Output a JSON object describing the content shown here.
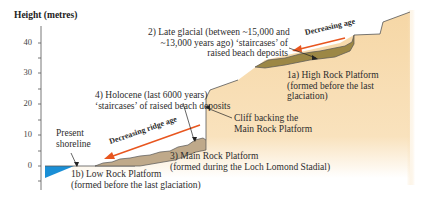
{
  "axis": {
    "title": "Height (metres)",
    "ticks": [
      "40",
      "30",
      "20",
      "10",
      "0"
    ]
  },
  "labels": {
    "late_glacial": [
      "2) Late glacial (between ~15,000 and",
      "~13,000 years ago) ‘staircases’ of",
      "raised beach deposits"
    ],
    "high_rock": [
      "1a) High Rock Platform",
      "(formed before the last",
      "glaciation)"
    ],
    "holocene": [
      "4) Holocene (last 6000 years)",
      "‘staircases’ of raised beach deposits"
    ],
    "cliff": [
      "Cliff backing the",
      "Main Rock Platform"
    ],
    "shoreline": [
      "Present",
      "shoreline"
    ],
    "main_rock": [
      "3) Main Rock Platform",
      "(formed during the Loch Lomond Stadial)"
    ],
    "low_rock": [
      "1b) Low Rock Platform",
      "(formed before the last glaciation)"
    ],
    "decreasing_age": "Decreasing age",
    "decreasing_ridge_age": "Decreasing ridge age"
  },
  "colors": {
    "sea": "#1a8fd6",
    "bedrock": "#f6d7a6",
    "holocene_deposit": "#bfa98a",
    "late_glacial_deposit": "#9c8745",
    "arrow": "#e8561f"
  }
}
